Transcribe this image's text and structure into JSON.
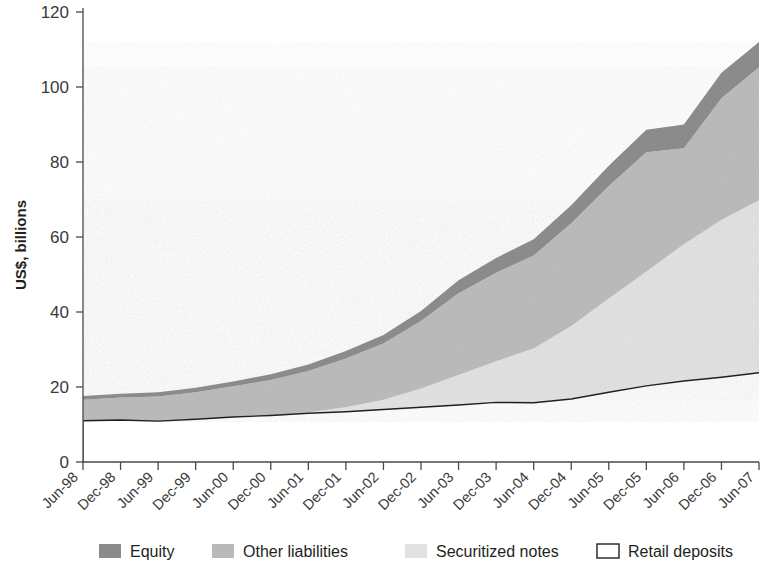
{
  "chart_data": {
    "type": "area",
    "stacked": true,
    "title": "",
    "subtitle": "",
    "xlabel": "",
    "ylabel": "US$, billions",
    "ylim": [
      0,
      120
    ],
    "yticks": [
      0,
      20,
      40,
      60,
      80,
      100,
      120
    ],
    "grid": false,
    "legend_position": "bottom",
    "categories": [
      "Jun-98",
      "Dec-98",
      "Jun-99",
      "Dec-99",
      "Jun-00",
      "Dec-00",
      "Jun-01",
      "Dec-01",
      "Jun-02",
      "Dec-02",
      "Jun-03",
      "Dec-03",
      "Jun-04",
      "Dec-04",
      "Jun-05",
      "Dec-05",
      "Jun-06",
      "Dec-06",
      "Jun-07"
    ],
    "series": [
      {
        "name": "Retail deposits",
        "color": "#ffffff",
        "stroke": "#231f20",
        "values": [
          11.0,
          11.2,
          10.9,
          11.4,
          12.0,
          12.4,
          13.0,
          13.4,
          14.0,
          14.6,
          15.2,
          15.9,
          15.8,
          16.8,
          18.6,
          20.3,
          21.6,
          22.6,
          23.8
        ]
      },
      {
        "name": "Securitized notes",
        "color": "#e2e2e2",
        "values": [
          0.0,
          0.0,
          0.0,
          0.0,
          0.0,
          0.0,
          0.3,
          1.2,
          2.6,
          5.0,
          8.0,
          11.0,
          14.5,
          19.5,
          25.0,
          30.5,
          36.5,
          42.0,
          46.0
        ]
      },
      {
        "name": "Other liabilities",
        "color": "#b9b9b9",
        "values": [
          5.6,
          6.0,
          6.6,
          7.2,
          8.2,
          9.5,
          11.0,
          13.0,
          15.0,
          18.0,
          21.8,
          23.6,
          24.8,
          27.4,
          30.0,
          31.8,
          25.6,
          32.4,
          35.5
        ]
      },
      {
        "name": "Equity",
        "color": "#8b8b8b",
        "values": [
          1.0,
          1.0,
          1.1,
          1.2,
          1.3,
          1.5,
          1.7,
          2.0,
          2.3,
          2.7,
          3.5,
          3.9,
          4.3,
          4.8,
          5.4,
          6.0,
          6.3,
          6.8,
          6.7
        ]
      }
    ],
    "totals": [
      17.6,
      18.2,
      18.6,
      19.8,
      21.5,
      23.4,
      26.0,
      29.6,
      33.9,
      40.3,
      48.5,
      54.4,
      59.4,
      68.5,
      79.0,
      88.6,
      90.0,
      103.8,
      112.0
    ]
  },
  "legend": {
    "items": [
      {
        "label": "Equity",
        "swatch": "dark-gray",
        "color": "#8b8b8b"
      },
      {
        "label": "Other liabilities",
        "swatch": "medium-gray",
        "color": "#b9b9b9"
      },
      {
        "label": "Securitized notes",
        "swatch": "light-gray",
        "color": "#e2e2e2"
      },
      {
        "label": "Retail deposits",
        "swatch": "white-outline",
        "color": "#ffffff"
      }
    ]
  }
}
